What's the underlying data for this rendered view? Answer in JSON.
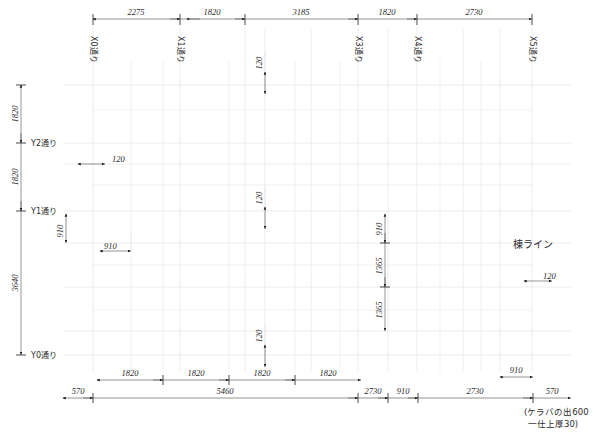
{
  "drawing": {
    "type": "architectural-floor-plan",
    "language": "ja",
    "units": "mm"
  },
  "top_dimensions": {
    "label": "top-dimension-chain",
    "y": 19,
    "values": [
      "2275",
      "1820",
      "3185",
      "1820",
      "2730"
    ],
    "tick_x": [
      93,
      180,
      245,
      358,
      417,
      532
    ]
  },
  "grid_labels_x": {
    "items": [
      {
        "text": "X0通り",
        "x": 93
      },
      {
        "text": "X1通り",
        "x": 180
      },
      {
        "text": "X3通り",
        "x": 358
      },
      {
        "text": "X4通り",
        "x": 417
      },
      {
        "text": "X5通り",
        "x": 532
      }
    ]
  },
  "grid_labels_y": {
    "items": [
      {
        "text": "Y2通り",
        "y": 143
      },
      {
        "text": "Y1通り",
        "y": 211
      },
      {
        "text": "Y0通り",
        "y": 355
      }
    ]
  },
  "left_dimensions": {
    "label": "left-dimension-chain",
    "x": 21,
    "values": [
      "1820",
      "1820",
      "3640"
    ],
    "tick_y": [
      85,
      143,
      211,
      355
    ]
  },
  "bottom_dimensions_inner": {
    "label": "bottom-inner-chain",
    "y": 380,
    "values": [
      "1820",
      "1820",
      "1820",
      "1820"
    ],
    "tick_x": [
      97,
      163,
      229,
      295,
      361
    ]
  },
  "bottom_dimensions_inner_right": {
    "label": "bottom-inner-right",
    "y": 377,
    "value": "910",
    "x1": 500,
    "x2": 533
  },
  "bottom_dimensions_outer": {
    "label": "bottom-outer-chain",
    "y": 398,
    "values": [
      "570",
      "5460",
      "2730",
      "910",
      "2730",
      "570"
    ],
    "tick_x": [
      63,
      93,
      358,
      388,
      418,
      533,
      571
    ]
  },
  "bottom_note": {
    "line1": "(ケラバの出600",
    "line2": "一仕上厚30)"
  },
  "ridge_label": {
    "text": "棟ライン",
    "x": 530,
    "y": 245
  },
  "callouts": [
    {
      "name": "callout-120-top-center",
      "text": "120",
      "orient": "v",
      "x": 265,
      "y1": 72,
      "y2": 94
    },
    {
      "name": "callout-120-mid-center",
      "text": "120",
      "orient": "v",
      "x": 265,
      "y1": 207,
      "y2": 229
    },
    {
      "name": "callout-120-low-center",
      "text": "120",
      "orient": "v",
      "x": 265,
      "y1": 345,
      "y2": 367
    },
    {
      "name": "callout-120-left",
      "text": "120",
      "orient": "h",
      "y": 164,
      "x1": 78,
      "x2": 105
    },
    {
      "name": "callout-910-left",
      "text": "910",
      "orient": "h",
      "y": 251,
      "x1": 100,
      "x2": 131
    },
    {
      "name": "callout-910-y1",
      "text": "910",
      "orient": "v",
      "x": 66,
      "y1": 214,
      "y2": 243
    },
    {
      "name": "callout-120-ridge",
      "text": "120",
      "orient": "h",
      "y": 281,
      "x1": 524,
      "x2": 552
    }
  ],
  "right_inner_chain": {
    "label": "right-inner-vertical-chain",
    "x": 385,
    "values": [
      "910",
      "1365",
      "1365"
    ],
    "tick_y": [
      214,
      243,
      287,
      331
    ]
  },
  "colors": {
    "ink": "#1c1c1c",
    "dim": "#3a3a3a",
    "faint_grid": "#d8d8d8",
    "paper": "#ffffff"
  }
}
